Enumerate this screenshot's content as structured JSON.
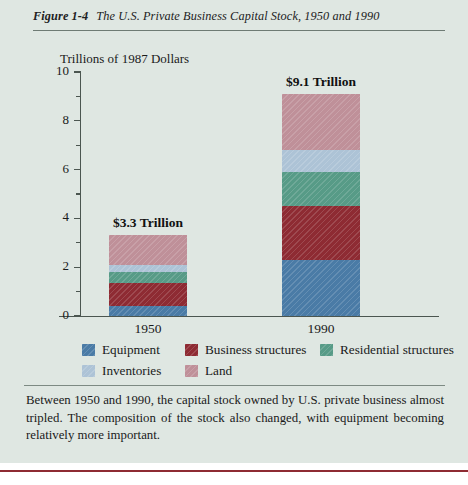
{
  "figure": {
    "number": "Figure 1-4",
    "title": "The U.S. Private Business Capital Stock, 1950 and 1990"
  },
  "caption": "Between 1950 and 1990, the capital stock owned by U.S. private business almost tripled. The composition of the stock also changed, with equipment becoming relatively more important.",
  "chart_data": {
    "type": "bar",
    "subtype": "stacked",
    "title": "The U.S. Private Business Capital Stock, 1950 and 1990",
    "ylabel": "Trillions of 1987 Dollars",
    "xlabel": "",
    "categories": [
      "1950",
      "1990"
    ],
    "ylim": [
      0,
      10
    ],
    "yticks": [
      0,
      2,
      4,
      6,
      8,
      10
    ],
    "ytick_labels": [
      "0",
      "2",
      "4",
      "6",
      "8",
      "10"
    ],
    "yminor_ticks": [
      1,
      3,
      5,
      7,
      9
    ],
    "grid": false,
    "legend_position": "bottom",
    "series": [
      {
        "name": "Equipment",
        "color": "#4a7ba6",
        "values": [
          0.4,
          2.3
        ]
      },
      {
        "name": "Business structures",
        "color": "#8e2b33",
        "values": [
          0.95,
          2.2
        ]
      },
      {
        "name": "Residential structures",
        "color": "#579b87",
        "values": [
          0.45,
          1.4
        ]
      },
      {
        "name": "Inventories",
        "color": "#adc3d6",
        "values": [
          0.3,
          0.9
        ]
      },
      {
        "name": "Land",
        "color": "#bf9099",
        "values": [
          1.2,
          2.3
        ]
      }
    ],
    "totals": [
      3.3,
      9.1
    ],
    "total_labels": [
      "$3.3 Trillion",
      "$9.1 Trillion"
    ],
    "annotations": [
      "$3.3 Trillion",
      "$9.1 Trillion"
    ]
  },
  "colors": {
    "page_background": "#dfe7e2",
    "axis": "#4b5650",
    "rule": "#8e2b33",
    "text": "#1a1a1a"
  }
}
